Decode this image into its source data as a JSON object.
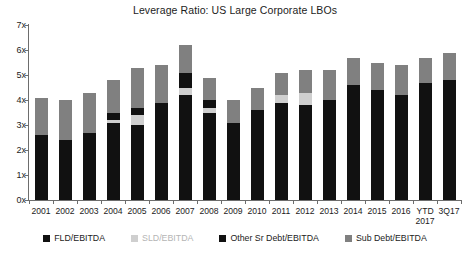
{
  "chart_data": {
    "type": "bar",
    "subtype": "stacked-bar",
    "title": "Leverage Ratio: US Large Corporate LBOs",
    "xlabel": "",
    "ylabel": "",
    "ylim": [
      0,
      7
    ],
    "ytick_values": [
      0,
      1,
      2,
      3,
      4,
      5,
      6,
      7
    ],
    "ytick_labels": [
      "0x",
      "1x",
      "2x",
      "3x",
      "4x",
      "5x",
      "6x",
      "7x"
    ],
    "grid": false,
    "legend_position": "bottom",
    "stacked": true,
    "categories": [
      "2001",
      "2002",
      "2003",
      "2004",
      "2005",
      "2006",
      "2007",
      "2008",
      "2009",
      "2010",
      "2011",
      "2012",
      "2013",
      "2014",
      "2015",
      "2016",
      "YTD\n2017",
      "3Q17"
    ],
    "series": [
      {
        "name": "FLD/EBITDA",
        "color": "#111111",
        "values": [
          2.6,
          2.4,
          2.7,
          3.1,
          3.0,
          3.6,
          4.2,
          3.5,
          3.1,
          3.6,
          3.9,
          3.8,
          4.0,
          4.3,
          4.1,
          3.9,
          4.4,
          4.5
        ]
      },
      {
        "name": "SLD/EBITDA",
        "color": "#cfcfcf",
        "values": [
          0.0,
          0.0,
          0.0,
          0.1,
          0.4,
          0.0,
          0.3,
          0.2,
          0.0,
          0.0,
          0.3,
          0.5,
          0.0,
          0.0,
          0.0,
          0.0,
          0.0,
          0.0
        ]
      },
      {
        "name": "Other Sr Debt/EBITDA",
        "color": "#111111",
        "values": [
          0.0,
          0.0,
          0.0,
          0.3,
          0.3,
          0.3,
          0.6,
          0.3,
          0.0,
          0.0,
          0.0,
          0.0,
          0.0,
          0.3,
          0.3,
          0.3,
          0.3,
          0.3
        ]
      },
      {
        "name": "Sub Debt/EBITDA",
        "color": "#808080",
        "values": [
          1.5,
          1.6,
          1.6,
          1.3,
          1.6,
          1.5,
          1.1,
          0.9,
          0.9,
          0.9,
          0.9,
          0.9,
          1.2,
          1.1,
          1.1,
          1.2,
          1.0,
          1.1
        ]
      }
    ],
    "totals": [
      4.1,
      4.0,
      4.3,
      4.8,
      5.3,
      5.4,
      6.2,
      4.9,
      4.0,
      4.5,
      5.1,
      5.2,
      5.2,
      5.7,
      5.5,
      5.4,
      5.7,
      5.9
    ],
    "legend": [
      {
        "label": "FLD/EBITDA",
        "color": "#111111",
        "muted": false
      },
      {
        "label": "SLD/EBITDA",
        "color": "#cfcfcf",
        "muted": true
      },
      {
        "label": "Other Sr Debt/EBITDA",
        "color": "#111111",
        "muted": false
      },
      {
        "label": "Sub Debt/EBITDA",
        "color": "#808080",
        "muted": false
      }
    ],
    "axis_color": "#6d6d6d",
    "background_color": "#ffffff"
  }
}
